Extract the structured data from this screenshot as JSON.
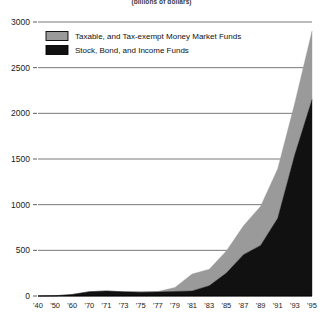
{
  "chart_data": {
    "type": "area",
    "title": "",
    "subtitle": "(billions of dollars)",
    "xlabel": "",
    "ylabel": "",
    "stacked": true,
    "grid": true,
    "legend_position": "top-left",
    "ylim": [
      0,
      3000
    ],
    "yticks": [
      0,
      500,
      1000,
      1500,
      2000,
      2500,
      3000
    ],
    "ytick_labels": [
      "0",
      "500",
      "1000",
      "1500",
      "2000",
      "2500",
      "3000"
    ],
    "categories": [
      "'40",
      "'50",
      "'60",
      "'70",
      "'71",
      "'73",
      "'75",
      "'77",
      "'79",
      "'81",
      "'83",
      "'85",
      "'87",
      "'89",
      "'91",
      "'93",
      "'95"
    ],
    "series": [
      {
        "name": "Stock, Bond, and Income Funds",
        "color": "#111111",
        "values": [
          0.5,
          2.5,
          17,
          47,
          55,
          46,
          42,
          45,
          49,
          55,
          113,
          251,
          453,
          554,
          852,
          1550,
          2150
        ]
      },
      {
        "name": "Taxable, and Tax-exempt Money Market Funds",
        "color": "#9a9a9a",
        "values": [
          0,
          0,
          0,
          0,
          0,
          0,
          4,
          4,
          45,
          186,
          179,
          243,
          316,
          428,
          542,
          565,
          750
        ]
      }
    ],
    "totals": [
      0.5,
      2.5,
      17,
      47,
      55,
      46,
      46,
      49,
      94,
      241,
      292,
      494,
      769,
      982,
      1394,
      2115,
      2900
    ]
  },
  "legend": {
    "items": [
      {
        "label": "Taxable, and Tax-exempt Money Market Funds",
        "color": "#9a9a9a"
      },
      {
        "label": "Stock, Bond, and Income Funds",
        "color": "#111111"
      }
    ]
  }
}
